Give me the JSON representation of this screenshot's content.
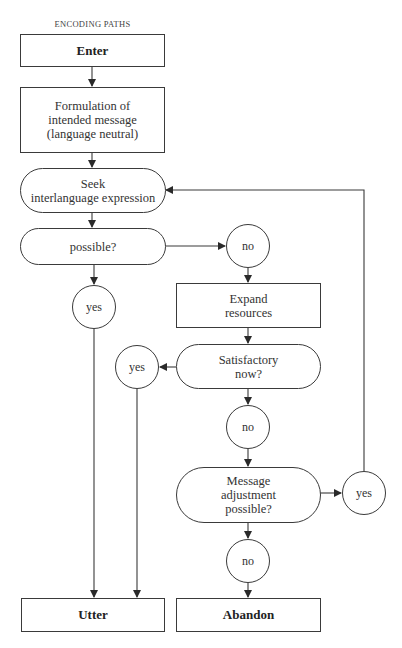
{
  "diagram": {
    "header": "ENCODING PATHS",
    "nodes": {
      "enter": "Enter",
      "formulation": "Formulation of\nintended message\n(language neutral)",
      "seek": "Seek\ninterlanguage  expression",
      "possible": "possible?",
      "no1": "no",
      "yes1": "yes",
      "expand": "Expand\nresources",
      "satisfactory": "Satisfactory\nnow?",
      "yes2": "yes",
      "no2": "no",
      "message_adjustment": "Message\nadjustment\npossible?",
      "yes3": "yes",
      "no3": "no",
      "utter": "Utter",
      "abandon": "Abandon"
    },
    "edges": [
      {
        "from": "enter",
        "to": "formulation"
      },
      {
        "from": "formulation",
        "to": "seek"
      },
      {
        "from": "seek",
        "to": "possible"
      },
      {
        "from": "possible",
        "to": "yes1"
      },
      {
        "from": "possible",
        "to": "no1"
      },
      {
        "from": "yes1",
        "to": "utter"
      },
      {
        "from": "no1",
        "to": "expand"
      },
      {
        "from": "expand",
        "to": "satisfactory"
      },
      {
        "from": "satisfactory",
        "to": "yes2"
      },
      {
        "from": "satisfactory",
        "to": "no2"
      },
      {
        "from": "yes2",
        "to": "utter"
      },
      {
        "from": "no2",
        "to": "message_adjustment"
      },
      {
        "from": "message_adjustment",
        "to": "yes3"
      },
      {
        "from": "message_adjustment",
        "to": "no3"
      },
      {
        "from": "yes3",
        "to": "seek"
      },
      {
        "from": "no3",
        "to": "abandon"
      }
    ],
    "colors": {
      "line": "#3a3a3a",
      "background": "#ffffff"
    }
  }
}
